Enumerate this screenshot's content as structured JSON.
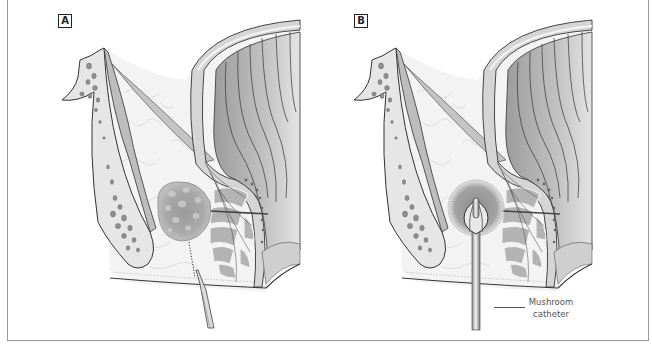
{
  "figure": {
    "type": "medical illustration"
  },
  "panels": [
    {
      "id": "A",
      "label": "A",
      "depiction": "abscess cavity with incision and drainage instrument"
    },
    {
      "id": "B",
      "label": "B",
      "depiction": "abscess drained with mushroom catheter in place"
    }
  ],
  "annotations": {
    "mushroom_catheter": {
      "line1": "Mushroom",
      "line2": "catheter"
    }
  },
  "colors": {
    "outline": "#333333",
    "fat": "#f3f3f3",
    "bone": "#e6e6e6",
    "bone_pores": "#8f8f8f",
    "muscle": "#bdbdbd",
    "rectal_wall": "#a9a9a9",
    "abscess": "#a6a6a6",
    "frame": "#9a9a9a"
  }
}
